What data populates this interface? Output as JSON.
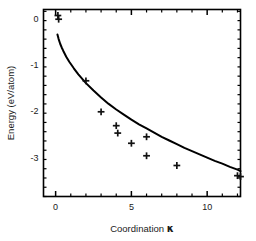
{
  "chart_data": {
    "type": "scatter",
    "title": "",
    "xlabel": "Coordination κ",
    "ylabel": "Energy (eV/atom)",
    "xlim": [
      -0.8,
      12.2
    ],
    "ylim": [
      -3.85,
      0.19
    ],
    "xticks": [
      0,
      5,
      10
    ],
    "xtick_labels": [
      "0",
      "5",
      "10"
    ],
    "yticks": [
      0,
      -1,
      -2,
      -3
    ],
    "ytick_labels": [
      "0",
      "-1",
      "-2",
      "-3"
    ],
    "x_minor_tick_step": 1,
    "y_minor_tick_step": 0.2,
    "grid": false,
    "legend": null,
    "marker": "plus",
    "marker_color": "#111111",
    "line_color": "#000000",
    "frame": "box",
    "tick_direction": "in",
    "series": [
      {
        "name": "data points",
        "type": "scatter",
        "marker": "plus",
        "x": [
          0.15,
          0.2,
          2.0,
          3.0,
          4.0,
          4.1,
          5.0,
          6.0,
          6.0,
          8.0,
          12.0,
          12.2
        ],
        "y": [
          0.06,
          -0.02,
          -1.35,
          -2.02,
          -2.32,
          -2.48,
          -2.7,
          -2.56,
          -2.97,
          -3.18,
          -3.4,
          -3.42
        ]
      },
      {
        "name": "fit curve",
        "type": "line",
        "x": [
          0.12,
          0.2,
          0.3,
          0.4,
          0.5,
          0.7,
          0.9,
          1.2,
          1.5,
          2.0,
          2.5,
          3.0,
          3.5,
          4.0,
          4.5,
          5.0,
          5.5,
          6.0,
          6.5,
          7.0,
          7.5,
          8.0,
          8.5,
          9.0,
          9.5,
          10.0,
          10.5,
          11.0,
          11.5,
          12.0,
          12.2
        ],
        "y": [
          -0.35,
          -0.45,
          -0.55,
          -0.63,
          -0.7,
          -0.83,
          -0.94,
          -1.08,
          -1.21,
          -1.4,
          -1.56,
          -1.71,
          -1.85,
          -1.97,
          -2.08,
          -2.19,
          -2.29,
          -2.38,
          -2.47,
          -2.56,
          -2.64,
          -2.72,
          -2.8,
          -2.87,
          -2.94,
          -3.01,
          -3.08,
          -3.14,
          -3.21,
          -3.27,
          -3.3
        ]
      }
    ]
  }
}
